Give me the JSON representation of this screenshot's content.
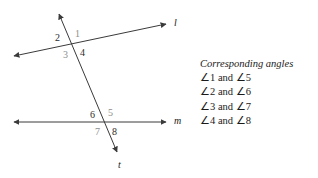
{
  "figure": {
    "background_color": "#ffffff",
    "stroke_color": "#3a3a3a",
    "lines": [
      {
        "name": "line-l",
        "label": "l",
        "label_x": 174,
        "label_y": 18
      },
      {
        "name": "line-m",
        "label": "m",
        "label_x": 174,
        "label_y": 116
      },
      {
        "name": "transversal-t",
        "label": "t",
        "label_x": 118,
        "label_y": 160
      }
    ],
    "angles": [
      {
        "id": "1",
        "label": "1",
        "x": 75,
        "y": 29,
        "faint": true
      },
      {
        "id": "2",
        "label": "2",
        "x": 55,
        "y": 33,
        "faint": false
      },
      {
        "id": "3",
        "label": "3",
        "x": 63,
        "y": 50,
        "faint": true
      },
      {
        "id": "4",
        "label": "4",
        "x": 80,
        "y": 48,
        "faint": false
      },
      {
        "id": "5",
        "label": "5",
        "x": 108,
        "y": 108,
        "faint": true
      },
      {
        "id": "6",
        "label": "6",
        "x": 90,
        "y": 110,
        "faint": false
      },
      {
        "id": "7",
        "label": "7",
        "x": 95,
        "y": 127,
        "faint": true
      },
      {
        "id": "8",
        "label": "8",
        "x": 112,
        "y": 127,
        "faint": false
      }
    ]
  },
  "legend": {
    "title": "Corresponding angles",
    "rows": [
      {
        "text": "∠1 and ∠5"
      },
      {
        "text": "∠2 and ∠6"
      },
      {
        "text": "∠3 and ∠7"
      },
      {
        "text": "∠4 and ∠8"
      }
    ]
  }
}
